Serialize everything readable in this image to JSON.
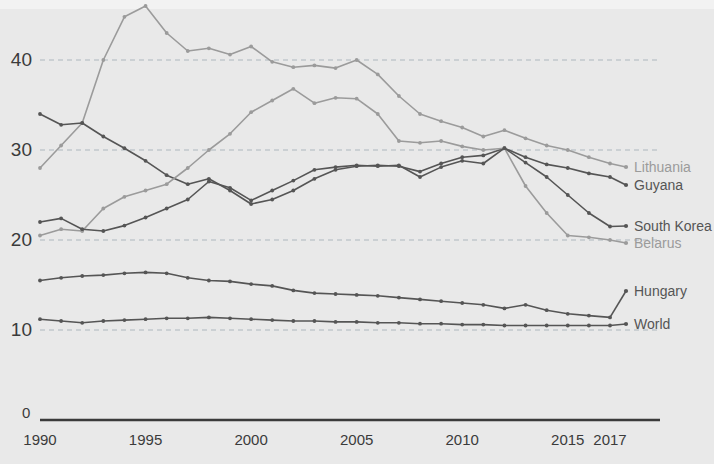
{
  "colors": {
    "background": "#e9e9e9",
    "axis": "#3b3b3b",
    "grid": "#9aa7b0",
    "dark_series": "#555555",
    "light_series": "#9b9b9b",
    "tick_text": "#3b3b3b"
  },
  "title_sliver": {
    "text": ""
  },
  "axes": {
    "y_ticks": [
      "10",
      "20",
      "30",
      "40"
    ],
    "y_zero": "0",
    "x_ticks": [
      "1990",
      "1995",
      "2000",
      "2005",
      "2010",
      "2015",
      "2017"
    ]
  },
  "chart_data": {
    "type": "line",
    "title": "",
    "xlabel": "",
    "ylabel": "",
    "xlim": [
      1990,
      2017
    ],
    "ylim": [
      0,
      48
    ],
    "grid": true,
    "gridlines": [
      10,
      20,
      30,
      40
    ],
    "legend_position": "right-inline",
    "x": [
      1990,
      1991,
      1992,
      1993,
      1994,
      1995,
      1996,
      1997,
      1998,
      1999,
      2000,
      2001,
      2002,
      2003,
      2004,
      2005,
      2006,
      2007,
      2008,
      2009,
      2010,
      2011,
      2012,
      2013,
      2014,
      2015,
      2016,
      2017
    ],
    "series": [
      {
        "name": "Lithuania",
        "color": "#9b9b9b",
        "values": [
          28.0,
          30.5,
          33.0,
          40.0,
          44.8,
          46.0,
          43.0,
          41.0,
          41.3,
          40.6,
          41.5,
          39.8,
          39.2,
          39.4,
          39.1,
          40.0,
          38.4,
          36.0,
          34.0,
          33.2,
          32.5,
          31.5,
          32.2,
          31.3,
          30.5,
          30.0,
          29.2,
          28.5
        ]
      },
      {
        "name": "Guyana",
        "color": "#555555",
        "values": [
          34.0,
          32.8,
          33.0,
          31.5,
          30.2,
          28.8,
          27.2,
          26.2,
          26.8,
          25.5,
          24.0,
          24.5,
          25.5,
          26.8,
          27.8,
          28.2,
          28.3,
          28.2,
          27.6,
          28.5,
          29.2,
          29.4,
          30.2,
          29.2,
          28.4,
          28.0,
          27.4,
          27.0
        ]
      },
      {
        "name": "Belarus",
        "color": "#9b9b9b",
        "values": [
          20.5,
          21.2,
          21.0,
          23.5,
          24.8,
          25.5,
          26.2,
          28.0,
          30.0,
          31.8,
          34.2,
          35.5,
          36.8,
          35.2,
          35.8,
          35.7,
          34.0,
          31.0,
          30.8,
          31.0,
          30.4,
          30.0,
          30.2,
          26.0,
          23.0,
          20.5,
          20.3,
          20.0
        ]
      },
      {
        "name": "South Korea",
        "color": "#555555",
        "values": [
          22.0,
          22.4,
          21.2,
          21.0,
          21.6,
          22.5,
          23.5,
          24.5,
          26.5,
          25.8,
          24.4,
          25.5,
          26.6,
          27.8,
          28.1,
          28.3,
          28.2,
          28.3,
          27.0,
          28.1,
          28.8,
          28.5,
          30.2,
          28.6,
          27.0,
          25.0,
          23.0,
          21.5
        ]
      },
      {
        "name": "Hungary",
        "color": "#555555",
        "values": [
          15.5,
          15.8,
          16.0,
          16.1,
          16.3,
          16.4,
          16.3,
          15.8,
          15.5,
          15.4,
          15.1,
          14.9,
          14.4,
          14.1,
          14.0,
          13.9,
          13.8,
          13.6,
          13.4,
          13.2,
          13.0,
          12.8,
          12.4,
          12.8,
          12.2,
          11.8,
          11.6,
          11.4
        ]
      },
      {
        "name": "World",
        "color": "#555555",
        "values": [
          11.2,
          11.0,
          10.8,
          11.0,
          11.1,
          11.2,
          11.3,
          11.3,
          11.4,
          11.3,
          11.2,
          11.1,
          11.0,
          11.0,
          10.9,
          10.9,
          10.8,
          10.8,
          10.7,
          10.7,
          10.6,
          10.6,
          10.5,
          10.5,
          10.5,
          10.5,
          10.5,
          10.5
        ]
      }
    ]
  },
  "legend": [
    {
      "label": "Lithuania",
      "color": "#9b9b9b"
    },
    {
      "label": "Guyana",
      "color": "#555555"
    },
    {
      "label": "South Korea",
      "color": "#555555"
    },
    {
      "label": "Belarus",
      "color": "#9b9b9b"
    },
    {
      "label": "Hungary",
      "color": "#555555"
    },
    {
      "label": "World",
      "color": "#555555"
    }
  ]
}
